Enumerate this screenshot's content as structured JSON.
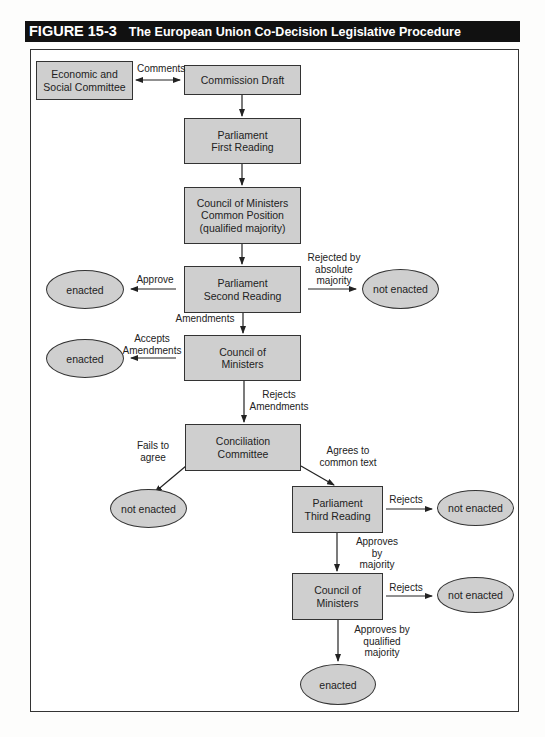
{
  "figure": {
    "number": "FIGURE 15-3",
    "title": "The European Union Co-Decision Legislative Procedure"
  },
  "nodes": {
    "esc": "Economic and\nSocial Committee",
    "commission_draft": "Commission Draft",
    "parl_first": "Parliament\nFirst Reading",
    "council_common": "Council of Ministers\nCommon Position\n(qualified majority)",
    "parl_second": "Parliament\nSecond Reading",
    "council_1": "Council of\nMinisters",
    "conciliation": "Conciliation\nCommittee",
    "parl_third": "Parliament\nThird Reading",
    "council_2": "Council of\nMinisters",
    "enacted_1": "enacted",
    "enacted_2": "enacted",
    "enacted_3": "enacted",
    "not_enacted_1": "not enacted",
    "not_enacted_2": "not enacted",
    "not_enacted_3": "not enacted",
    "not_enacted_4": "not enacted"
  },
  "edges": {
    "comments": "Comments",
    "approve": "Approve",
    "rejected_absolute": "Rejected by\nabsolute\nmajority",
    "amendments": "Amendments",
    "accepts_amendments": "Accepts\nAmendments",
    "rejects_amendments": "Rejects\nAmendments",
    "fails_to_agree": "Fails to\nagree",
    "agrees_common_text": "Agrees to\ncommon text",
    "rejects_1": "Rejects",
    "approves_majority": "Approves\nby\nmajority",
    "rejects_2": "Rejects",
    "approves_qualified": "Approves by\nqualified\nmajority"
  },
  "colors": {
    "node_fill": "#cfcfcf",
    "stroke": "#333333",
    "title_bar": "#111111"
  }
}
